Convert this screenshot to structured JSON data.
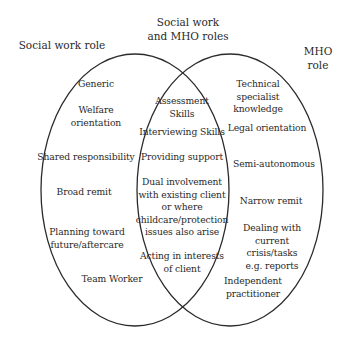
{
  "diagram": {
    "type": "venn",
    "headings": {
      "left": "Social work role",
      "center": "Social work\nand MHO roles",
      "right": "MHO role"
    },
    "left_only": [
      "Generic",
      "Welfare\norientation",
      "Shared responsibility",
      "Broad remit",
      "Planning toward\nfuture/aftercare",
      "Team Worker"
    ],
    "overlap": [
      "Assessment\nSkills",
      "Interviewing Skills",
      "Providing support",
      "Dual involvement\nwith existing client\nor where\nchildcare/protection\nissues also arise",
      "Acting in interests\nof client"
    ],
    "right_only": [
      "Technical\nspecialist\nknowledge",
      "Legal orientation",
      "Semi-autonomous",
      "Narrow remit",
      "Dealing with\ncurrent crisis/tasks\ne.g. reports",
      "Independent\npractitioner"
    ],
    "colors": {
      "stroke": "#2b2b2b",
      "text": "#2a2a2a",
      "background": "#ffffff"
    }
  }
}
